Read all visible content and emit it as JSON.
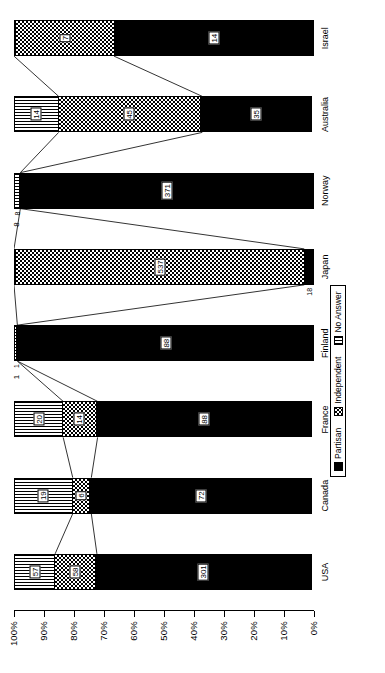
{
  "chart_data": {
    "type": "bar",
    "title": "",
    "subtitle": "",
    "xlabel": "",
    "ylabel": "",
    "stacked": true,
    "percent_stacked": true,
    "orientation": "vertical-rotated-90",
    "grid": false,
    "legend_position": "bottom-right",
    "categories": [
      "USA",
      "Canada",
      "France",
      "Finland",
      "Japan",
      "Norway",
      "Australia",
      "Israel"
    ],
    "ylim": [
      0,
      100
    ],
    "ytick_labels": [
      "0%",
      "10%",
      "20%",
      "30%",
      "40%",
      "50%",
      "60%",
      "70%",
      "80%",
      "90%",
      "100%"
    ],
    "ytick_values": [
      0,
      10,
      20,
      30,
      40,
      50,
      60,
      70,
      80,
      90,
      100
    ],
    "series": [
      {
        "name": "Partisan",
        "fill": "solid-black",
        "values": [
          301,
          72,
          88,
          88,
          18,
          371,
          35,
          14
        ]
      },
      {
        "name": "Independent",
        "fill": "checkered",
        "values": [
          58,
          6,
          14,
          0,
          537,
          0,
          45,
          7
        ]
      },
      {
        "name": "No Answer",
        "fill": "vertical-stripe",
        "values": [
          57,
          19,
          20,
          1,
          0,
          8,
          14,
          0
        ]
      }
    ],
    "annotations": [
      {
        "text": "1",
        "category": "Finland",
        "series": "No Answer",
        "position": "outside"
      },
      {
        "text": "8",
        "category": "Norway",
        "series": "No Answer",
        "position": "outside"
      }
    ]
  },
  "legend": {
    "items": [
      {
        "label": "Partisan",
        "fill": "solid-black"
      },
      {
        "label": "Independent",
        "fill": "checkered"
      },
      {
        "label": "No Answer",
        "fill": "vertical-stripe"
      }
    ]
  },
  "axis": {
    "y_labels": [
      "100%",
      "90%",
      "80%",
      "70%",
      "60%",
      "50%",
      "40%",
      "30%",
      "20%",
      "10%",
      "0%"
    ]
  }
}
